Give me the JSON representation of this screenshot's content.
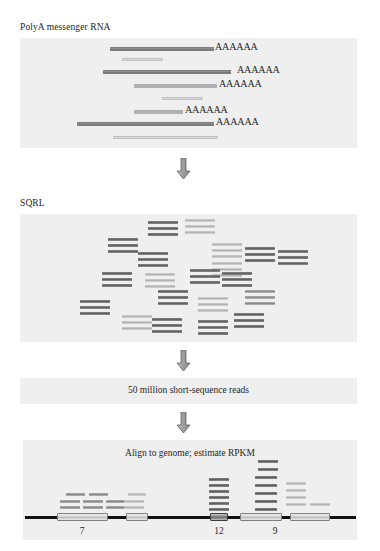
{
  "figure": {
    "title": "RNA-seq workflow schematic",
    "background_color": "#ffffff",
    "panel_color": "#efefef"
  },
  "steps": {
    "polya_label": "PolyA messenger RNA",
    "sqrl_label": "SQRL",
    "reads_box_label": "50 million short-sequence reads",
    "align_label": "Align to genome; estimate RPKM"
  },
  "polya_panel": {
    "box": {
      "x": 20,
      "y": 38,
      "w": 337,
      "h": 110
    },
    "transcripts": [
      {
        "x": 110,
        "y": 47,
        "w": 104,
        "h": 4.0,
        "shade": "dark",
        "tail": "AAAAAA",
        "tail_x": 215
      },
      {
        "x": 122,
        "y": 58,
        "w": 41,
        "h": 3.2,
        "shade": "light",
        "tail": ""
      },
      {
        "x": 103,
        "y": 70,
        "w": 128,
        "h": 4.2,
        "shade": "dark",
        "tail": "AAAAAA",
        "tail_x": 237
      },
      {
        "x": 134,
        "y": 84,
        "w": 83,
        "h": 3.6,
        "shade": "mid",
        "tail": "AAAAAA",
        "tail_x": 219
      },
      {
        "x": 162,
        "y": 97,
        "w": 41,
        "h": 2.8,
        "shade": "light",
        "tail": ""
      },
      {
        "x": 134,
        "y": 110,
        "w": 49,
        "h": 3.6,
        "shade": "mid",
        "tail": "AAAAAA",
        "tail_x": 185
      },
      {
        "x": 77,
        "y": 122,
        "w": 137,
        "h": 4.2,
        "shade": "dark",
        "tail": "AAAAAA",
        "tail_x": 216
      },
      {
        "x": 113,
        "y": 136,
        "w": 105,
        "h": 3.2,
        "shade": "light",
        "tail": ""
      }
    ]
  },
  "sqrl_panel": {
    "box": {
      "x": 20,
      "y": 214,
      "w": 337,
      "h": 128
    },
    "clusters": [
      {
        "x": 148,
        "y": 221,
        "w": 30,
        "n": 3,
        "shade": "dark"
      },
      {
        "x": 185,
        "y": 219,
        "w": 30,
        "n": 3,
        "shade": "light"
      },
      {
        "x": 108,
        "y": 238,
        "w": 30,
        "n": 3,
        "shade": "dark"
      },
      {
        "x": 212,
        "y": 243,
        "w": 30,
        "n": 3,
        "shade": "light"
      },
      {
        "x": 138,
        "y": 252,
        "w": 30,
        "n": 3,
        "shade": "dark"
      },
      {
        "x": 212,
        "y": 262,
        "w": 30,
        "n": 3,
        "shade": "light"
      },
      {
        "x": 245,
        "y": 247,
        "w": 30,
        "n": 3,
        "shade": "dark"
      },
      {
        "x": 102,
        "y": 272,
        "w": 30,
        "n": 3,
        "shade": "dark"
      },
      {
        "x": 145,
        "y": 273,
        "w": 30,
        "n": 3,
        "shade": "light"
      },
      {
        "x": 190,
        "y": 269,
        "w": 30,
        "n": 3,
        "shade": "dark"
      },
      {
        "x": 222,
        "y": 272,
        "w": 30,
        "n": 3,
        "shade": "dark"
      },
      {
        "x": 245,
        "y": 290,
        "w": 30,
        "n": 3,
        "shade": "mid"
      },
      {
        "x": 278,
        "y": 250,
        "w": 30,
        "n": 3,
        "shade": "dark"
      },
      {
        "x": 80,
        "y": 300,
        "w": 30,
        "n": 3,
        "shade": "dark"
      },
      {
        "x": 158,
        "y": 290,
        "w": 30,
        "n": 3,
        "shade": "dark"
      },
      {
        "x": 198,
        "y": 297,
        "w": 30,
        "n": 3,
        "shade": "light"
      },
      {
        "x": 122,
        "y": 315,
        "w": 30,
        "n": 3,
        "shade": "light"
      },
      {
        "x": 152,
        "y": 318,
        "w": 30,
        "n": 3,
        "shade": "dark"
      },
      {
        "x": 198,
        "y": 320,
        "w": 30,
        "n": 3,
        "shade": "dark"
      },
      {
        "x": 234,
        "y": 313,
        "w": 30,
        "n": 3,
        "shade": "dark"
      }
    ]
  },
  "reads_panel": {
    "box": {
      "x": 20,
      "y": 378,
      "w": 337,
      "h": 26
    }
  },
  "align_panel": {
    "box": {
      "x": 23,
      "y": 440,
      "w": 334,
      "h": 100
    },
    "axis": {
      "y": 516,
      "segments": [
        {
          "x": 25,
          "w": 32
        },
        {
          "x": 108,
          "w": 18
        },
        {
          "x": 148,
          "w": 62
        },
        {
          "x": 228,
          "w": 42
        },
        {
          "x": 282,
          "w": 8
        },
        {
          "x": 330,
          "w": 26
        }
      ]
    },
    "exons": [
      {
        "x": 57,
        "w": 51,
        "shade": "light",
        "count": "7",
        "count_x": 82
      },
      {
        "x": 126,
        "w": 22,
        "shade": "light",
        "count": ""
      },
      {
        "x": 210,
        "w": 18,
        "shade": "dark",
        "count": "12",
        "count_x": 219
      },
      {
        "x": 240,
        "w": 42,
        "shade": "light",
        "count": "9",
        "count_x": 275
      },
      {
        "x": 290,
        "w": 40,
        "shade": "light",
        "count": ""
      }
    ],
    "reads": [
      {
        "x": 66,
        "y": 493,
        "w": 19,
        "shade": "mid"
      },
      {
        "x": 89,
        "y": 493,
        "w": 19,
        "shade": "mid"
      },
      {
        "x": 60,
        "y": 500,
        "w": 20,
        "shade": "mid"
      },
      {
        "x": 83,
        "y": 500,
        "w": 20,
        "shade": "mid"
      },
      {
        "x": 106,
        "y": 500,
        "w": 20,
        "shade": "mid"
      },
      {
        "x": 60,
        "y": 506,
        "w": 20,
        "shade": "mid"
      },
      {
        "x": 83,
        "y": 506,
        "w": 20,
        "shade": "mid"
      },
      {
        "x": 106,
        "y": 506,
        "w": 20,
        "shade": "mid"
      },
      {
        "x": 128,
        "y": 493,
        "w": 18,
        "shade": "light"
      },
      {
        "x": 124,
        "y": 500,
        "w": 20,
        "shade": "light"
      },
      {
        "x": 124,
        "y": 506,
        "w": 20,
        "shade": "light"
      },
      {
        "x": 209,
        "y": 478,
        "w": 20,
        "shade": "dark"
      },
      {
        "x": 209,
        "y": 484,
        "w": 20,
        "shade": "dark"
      },
      {
        "x": 209,
        "y": 490,
        "w": 20,
        "shade": "dark"
      },
      {
        "x": 209,
        "y": 496,
        "w": 20,
        "shade": "dark"
      },
      {
        "x": 209,
        "y": 502,
        "w": 20,
        "shade": "dark"
      },
      {
        "x": 209,
        "y": 508,
        "w": 20,
        "shade": "dark"
      },
      {
        "x": 258,
        "y": 460,
        "w": 20,
        "shade": "dark"
      },
      {
        "x": 258,
        "y": 468,
        "w": 20,
        "shade": "dark"
      },
      {
        "x": 255,
        "y": 476,
        "w": 22,
        "shade": "dark"
      },
      {
        "x": 255,
        "y": 484,
        "w": 22,
        "shade": "dark"
      },
      {
        "x": 255,
        "y": 492,
        "w": 22,
        "shade": "dark"
      },
      {
        "x": 255,
        "y": 500,
        "w": 22,
        "shade": "dark"
      },
      {
        "x": 255,
        "y": 508,
        "w": 22,
        "shade": "dark"
      },
      {
        "x": 286,
        "y": 482,
        "w": 20,
        "shade": "light"
      },
      {
        "x": 286,
        "y": 489,
        "w": 20,
        "shade": "light"
      },
      {
        "x": 286,
        "y": 496,
        "w": 20,
        "shade": "light"
      },
      {
        "x": 286,
        "y": 503,
        "w": 20,
        "shade": "light"
      },
      {
        "x": 310,
        "y": 503,
        "w": 20,
        "shade": "light"
      }
    ]
  },
  "arrows": [
    {
      "name": "arrow-polya-to-sqrl",
      "x": 176,
      "y": 158
    },
    {
      "name": "arrow-sqrl-to-reads",
      "x": 176,
      "y": 350
    },
    {
      "name": "arrow-reads-to-align",
      "x": 176,
      "y": 412
    }
  ]
}
